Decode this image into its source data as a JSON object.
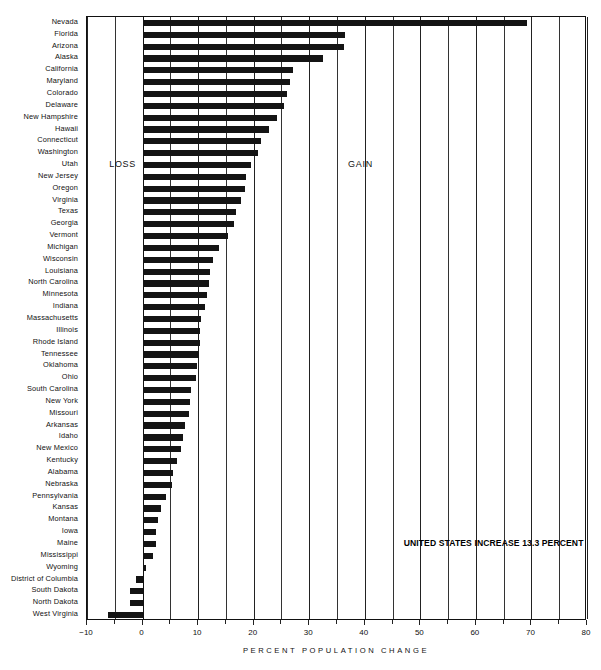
{
  "chart_data": {
    "type": "bar",
    "orientation": "horizontal",
    "title": "",
    "xlabel": "PERCENT POPULATION CHANGE",
    "ylabel": "",
    "xlim": [
      -10,
      80
    ],
    "xticks": [
      -10,
      0,
      10,
      20,
      30,
      40,
      50,
      60,
      70,
      80
    ],
    "xticklabels": [
      "−10",
      "0",
      "10",
      "20",
      "30",
      "40",
      "50",
      "60",
      "70",
      "80"
    ],
    "grid": true,
    "legend": null,
    "annotations": [
      {
        "text": "LOSS",
        "x": -6.0,
        "y_index": 12
      },
      {
        "text": "GAIN",
        "x": 37.0,
        "y_index": 12
      },
      {
        "text": "UNITED STATES INCREASE 13.3 PERCENT",
        "x": 47.0,
        "y_index": 44
      }
    ],
    "categories": [
      "Nevada",
      "Florida",
      "Arizona",
      "Alaska",
      "California",
      "Maryland",
      "Colorado",
      "Delaware",
      "New Hampshire",
      "Hawaii",
      "Connecticut",
      "Washington",
      "Utah",
      "New Jersey",
      "Oregon",
      "Virginia",
      "Texas",
      "Georgia",
      "Vermont",
      "Michigan",
      "Wisconsin",
      "Louisiana",
      "North Carolina",
      "Minnesota",
      "Indiana",
      "Massachusetts",
      "Illinois",
      "Rhode Island",
      "Tennessee",
      "Oklahoma",
      "Ohio",
      "South Carolina",
      "New York",
      "Missouri",
      "Arkansas",
      "Idaho",
      "New Mexico",
      "Kentucky",
      "Alabama",
      "Nebraska",
      "Pennsylvania",
      "Kansas",
      "Montana",
      "Iowa",
      "Maine",
      "Mississippi",
      "Wyoming",
      "District of Columbia",
      "South Dakota",
      "North Dakota",
      "West Virginia"
    ],
    "values": [
      69.2,
      36.4,
      36.2,
      32.4,
      27.1,
      26.6,
      26.0,
      25.5,
      24.2,
      22.8,
      21.4,
      20.7,
      19.5,
      18.6,
      18.4,
      17.7,
      16.9,
      16.5,
      15.4,
      13.7,
      12.6,
      12.2,
      12.0,
      11.6,
      11.3,
      10.6,
      10.4,
      10.3,
      10.1,
      9.8,
      9.6,
      8.8,
      8.5,
      8.3,
      7.7,
      7.2,
      6.9,
      6.2,
      5.5,
      5.3,
      4.3,
      3.4,
      2.8,
      2.4,
      2.4,
      1.8,
      0.7,
      -1.1,
      -2.2,
      -2.3,
      -6.2
    ]
  }
}
